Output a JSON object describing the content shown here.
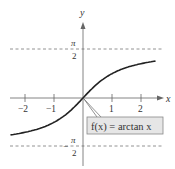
{
  "chart_data": {
    "type": "line",
    "title": "",
    "function_label": "f(x) = arctan x",
    "xlabel": "x",
    "ylabel": "y",
    "xlim": [
      -2.5,
      2.5
    ],
    "ylim": [
      -1.9,
      2.9
    ],
    "x_ticks": [
      "-2",
      "-1",
      "1",
      "2"
    ],
    "y_ticks": [
      "π/2",
      "-π/2"
    ],
    "asymptotes": [
      {
        "y": 1.5708,
        "label": "π/2",
        "style": "dashed"
      },
      {
        "y": -1.5708,
        "label": "-π/2",
        "style": "dashed"
      }
    ],
    "series": [
      {
        "name": "f(x) = arctan x",
        "x": [
          -2.5,
          -2,
          -1.5,
          -1,
          -0.5,
          0,
          0.5,
          1,
          1.5,
          2,
          2.5
        ],
        "y": [
          -1.19,
          -1.107,
          -0.983,
          -0.785,
          -0.464,
          0,
          0.464,
          0.785,
          0.983,
          1.107,
          1.19
        ]
      }
    ],
    "grid": false,
    "legend": "callout label box near origin, lower right"
  },
  "labels": {
    "x_axis": "x",
    "y_axis": "y",
    "tick_neg2": "−2",
    "tick_neg1": "−1",
    "tick_1": "1",
    "tick_2": "2",
    "pi": "π",
    "two": "2",
    "minus": "−",
    "callout": "f(x) = arctan x"
  },
  "colors": {
    "axis": "#666666",
    "curve": "#222222",
    "dash": "#777777",
    "callout_bg": "#e6e6e6",
    "callout_border": "#888888"
  }
}
